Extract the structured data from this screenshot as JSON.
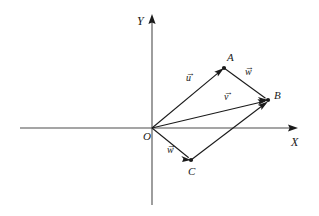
{
  "figure": {
    "type": "vector-diagram",
    "background_color": "#ffffff",
    "stroke_color": "#1a1a1a",
    "axes": {
      "x": {
        "label": "X",
        "label_pos": {
          "x": 291,
          "y": 136
        },
        "line": {
          "x1": 20,
          "y1": 128,
          "x2": 298,
          "y2": 128
        },
        "arrow_at": "end"
      },
      "y": {
        "label": "Y",
        "label_pos": {
          "x": 137,
          "y": 15
        },
        "line": {
          "x1": 152,
          "y1": 205,
          "x2": 152,
          "y2": 14
        },
        "arrow_at": "end"
      }
    },
    "points": [
      {
        "id": "O",
        "label": "O",
        "x": 152,
        "y": 128,
        "label_pos": {
          "x": 143,
          "y": 131
        },
        "dot": false
      },
      {
        "id": "A",
        "label": "A",
        "x": 224,
        "y": 68,
        "label_pos": {
          "x": 227,
          "y": 52
        },
        "dot": true
      },
      {
        "id": "B",
        "label": "B",
        "x": 268,
        "y": 100,
        "label_pos": {
          "x": 274,
          "y": 90
        },
        "dot": true
      },
      {
        "id": "C",
        "label": "C",
        "x": 191,
        "y": 160,
        "label_pos": {
          "x": 188,
          "y": 166
        },
        "dot": true
      }
    ],
    "vectors": [
      {
        "id": "OA",
        "from": "O",
        "to": "A",
        "label": "u",
        "label_pos": {
          "x": 186,
          "y": 72
        },
        "arrow": true
      },
      {
        "id": "AB",
        "from": "A",
        "to": "B",
        "label": "w",
        "label_pos": {
          "x": 245,
          "y": 66
        },
        "arrow": true
      },
      {
        "id": "OB",
        "from": "O",
        "to": "B",
        "label": "v",
        "label_pos": {
          "x": 224,
          "y": 91
        },
        "arrow": true
      },
      {
        "id": "OC",
        "from": "O",
        "to": "C",
        "label": "w",
        "label_pos": {
          "x": 167,
          "y": 144
        },
        "arrow": true
      },
      {
        "id": "CB",
        "from": "C",
        "to": "B",
        "label": "",
        "label_pos": null,
        "arrow": true
      }
    ],
    "vector_accent": "→"
  }
}
